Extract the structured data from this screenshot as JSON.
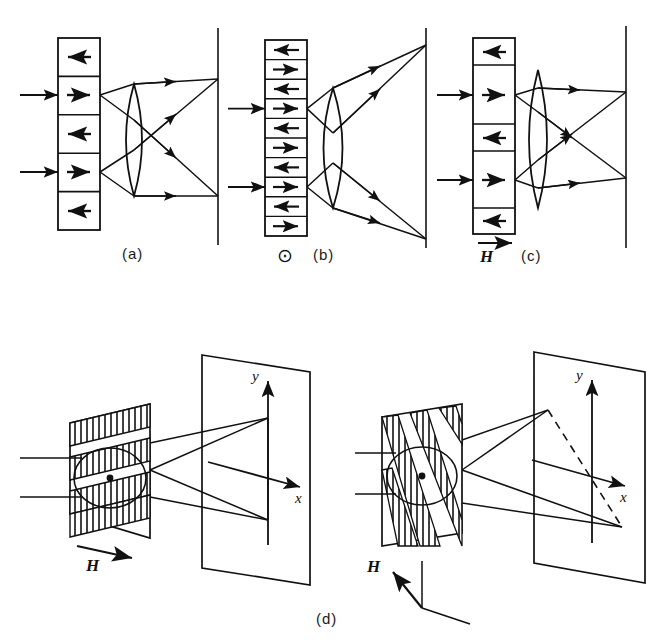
{
  "figure": {
    "ink_color": "#111111",
    "background": "#ffffff"
  },
  "captions": {
    "a": "(a)",
    "b": "(b)",
    "c": "(c)",
    "d": "(d)"
  },
  "symbols": {
    "field_out_of_page": "⊙",
    "field_label": "H"
  },
  "axes": {
    "y_label": "y",
    "x_label": "x"
  },
  "panels": [
    {
      "id": "a",
      "caption": "(a)",
      "description": "Equal-width stripe domains, zero applied field",
      "domain_count": 5,
      "domain_arrows": [
        "left",
        "right",
        "left",
        "right",
        "left"
      ],
      "incoming_rays": 2,
      "diffraction_orders": 2,
      "field_symbol": null
    },
    {
      "id": "b",
      "caption": "(b)",
      "description": "Narrow equal stripe domains, field out of page",
      "domain_count": 10,
      "domain_arrows": [
        "left",
        "right",
        "left",
        "right",
        "left",
        "right",
        "left",
        "right",
        "left",
        "right"
      ],
      "incoming_rays": 2,
      "diffraction_orders": 2,
      "field_symbol": "⊙"
    },
    {
      "id": "c",
      "caption": "(c)",
      "description": "Unequal stripe domains under in-plane field H",
      "domain_count": 5,
      "domain_arrows": [
        "left",
        "right",
        "left",
        "right",
        "left"
      ],
      "incoming_rays": 2,
      "diffraction_orders": 3,
      "field_symbol": "H",
      "field_direction": "right"
    },
    {
      "id": "d-left",
      "caption": "(d)",
      "description": "Three-dimensional view: horizontal stripe domains, H in plane to the right",
      "hatching": "horizontal-bands",
      "field_symbol": "H",
      "field_direction": "right",
      "spots_on_screen": 3,
      "axis_labels": [
        "y",
        "x"
      ]
    },
    {
      "id": "d-right",
      "caption": "(d)",
      "description": "Three-dimensional view: tilted stripe domains, H rotated, diffraction line tilted (dashed)",
      "hatching": "diagonal-bands",
      "field_symbol": "H",
      "field_direction": "up-left",
      "spots_on_screen": 3,
      "axis_labels": [
        "y",
        "x"
      ],
      "dashed_line": true
    }
  ]
}
